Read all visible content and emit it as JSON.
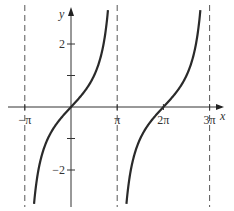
{
  "chart_data": {
    "type": "line",
    "title": "",
    "function": "y = tan(x/2)",
    "xlabel": "x",
    "ylabel": "y",
    "xlim": [
      -3.6,
      10.5
    ],
    "ylim": [
      -3.2,
      3.4
    ],
    "x_ticks": [
      {
        "value": -3.14159,
        "label": "−π"
      },
      {
        "value": 3.14159,
        "label": "π"
      },
      {
        "value": 6.28318,
        "label": "2π"
      },
      {
        "value": 9.42478,
        "label": "3π"
      }
    ],
    "y_ticks": [
      {
        "value": 2,
        "label": "2"
      },
      {
        "value": 1,
        "label": ""
      },
      {
        "value": -1,
        "label": ""
      },
      {
        "value": -2,
        "label": "−2"
      }
    ],
    "asymptotes": [
      -3.14159,
      3.14159,
      9.42478
    ],
    "grid": false,
    "series": [
      {
        "name": "tan(x/2) branch 1",
        "x_range": [
          -3.14159,
          3.14159
        ]
      },
      {
        "name": "tan(x/2) branch 2",
        "x_range": [
          3.14159,
          9.42478
        ]
      }
    ]
  },
  "axis": {
    "x_name": "x",
    "y_name": "y"
  }
}
